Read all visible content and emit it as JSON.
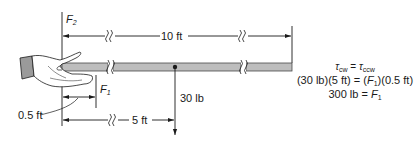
{
  "diagram": {
    "labels": {
      "f2_name": "F",
      "f2_sub": "2",
      "f1_name": "F",
      "f1_sub": "1",
      "length_total": "10 ft",
      "length_weight": "5 ft",
      "length_grip": "0.5 ft",
      "weight": "30 lb"
    },
    "equations": {
      "line1_left": "τ",
      "line1_left_sub": "cw",
      "line1_eq": " = ",
      "line1_right": "τ",
      "line1_right_sub": "ccw",
      "line2_prefix": "(30 lb)(5 ft) = (",
      "line2_var": "F",
      "line2_var_sub": "1",
      "line2_suffix": ")(0.5 ft)",
      "line3_prefix": "300 lb = ",
      "line3_var": "F",
      "line3_var_sub": "1"
    },
    "colors": {
      "line": "#1a1a1a",
      "rod_fill": "#bdbdbd",
      "rod_stroke": "#4a4a4a",
      "hand_fill": "#ffffff",
      "cuff_fill": "#9a9a9a"
    }
  }
}
